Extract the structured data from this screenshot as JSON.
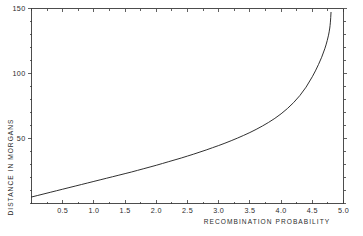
{
  "chart_data": {
    "type": "line",
    "title": "",
    "xlabel": "RECOMBINATION PROBABILITY",
    "ylabel": "DISTANCE IN MORGANS",
    "xlim": [
      0,
      5.0
    ],
    "ylim": [
      0,
      150
    ],
    "grid": false,
    "legend": null,
    "x_ticks": [
      0.5,
      1.0,
      1.5,
      2.0,
      2.5,
      3.0,
      3.5,
      4.0,
      4.5,
      5.0
    ],
    "x_tick_labels": [
      "0.5",
      "1.0",
      "1.5",
      "2.0",
      "2.5",
      "3.0",
      "3.5",
      "4.0",
      "4.5",
      "5.0"
    ],
    "x_minor_tick_step": 0.25,
    "y_ticks": [
      50,
      100,
      150
    ],
    "y_tick_labels": [
      "50",
      "100",
      "150"
    ],
    "y_minor_tick_step": 10,
    "series": [
      {
        "name": "mapping function",
        "x": [
          0.0,
          0.1,
          0.2,
          0.3,
          0.4,
          0.5,
          0.6,
          0.7,
          0.8,
          0.9,
          1.0,
          1.1,
          1.2,
          1.3,
          1.4,
          1.5,
          1.6,
          1.7,
          1.8,
          1.9,
          2.0,
          2.1,
          2.2,
          2.3,
          2.4,
          2.5,
          2.6,
          2.7,
          2.8,
          2.9,
          3.0,
          3.1,
          3.2,
          3.3,
          3.4,
          3.5,
          3.6,
          3.7,
          3.8,
          3.9,
          4.0,
          4.1,
          4.2,
          4.3,
          4.4,
          4.5,
          4.55,
          4.6,
          4.65,
          4.7,
          4.72,
          4.74,
          4.76,
          4.77,
          4.78,
          4.785,
          4.79,
          4.795,
          4.8
        ],
        "y": [
          5.0,
          6.2,
          7.4,
          8.6,
          9.8,
          11.0,
          12.2,
          13.4,
          14.6,
          15.8,
          17.0,
          18.2,
          19.4,
          20.6,
          21.8,
          23.0,
          24.2,
          25.5,
          26.8,
          28.1,
          29.4,
          30.8,
          32.2,
          33.6,
          35.0,
          36.5,
          38.0,
          39.6,
          41.2,
          42.9,
          44.6,
          46.4,
          48.3,
          50.3,
          52.4,
          54.6,
          57.0,
          59.6,
          62.4,
          65.5,
          69.0,
          73.0,
          77.6,
          83.0,
          89.5,
          97.5,
          102.0,
          107.0,
          112.5,
          119.0,
          122.0,
          125.5,
          129.5,
          132.0,
          135.0,
          137.0,
          139.5,
          143.0,
          147.0
        ],
        "color": "#262626"
      }
    ]
  },
  "axes": {
    "x_title": "RECOMBINATION PROBABILITY",
    "y_title": "DISTANCE IN MORGANS"
  },
  "ticks": {
    "x": [
      {
        "value": 0.5,
        "label": "0.5"
      },
      {
        "value": 1.0,
        "label": "1.0"
      },
      {
        "value": 1.5,
        "label": "1.5"
      },
      {
        "value": 2.0,
        "label": "2.0"
      },
      {
        "value": 2.5,
        "label": "2.5"
      },
      {
        "value": 3.0,
        "label": "3.0"
      },
      {
        "value": 3.5,
        "label": "3.5"
      },
      {
        "value": 4.0,
        "label": "4.0"
      },
      {
        "value": 4.5,
        "label": "4.5"
      },
      {
        "value": 5.0,
        "label": "5.0"
      }
    ],
    "y": [
      {
        "value": 50,
        "label": "50"
      },
      {
        "value": 100,
        "label": "100"
      },
      {
        "value": 150,
        "label": "150"
      }
    ]
  },
  "colors": {
    "background": "#ffffff",
    "axis": "#3a3a3a",
    "curve": "#262626",
    "text": "#2b2b2b"
  }
}
